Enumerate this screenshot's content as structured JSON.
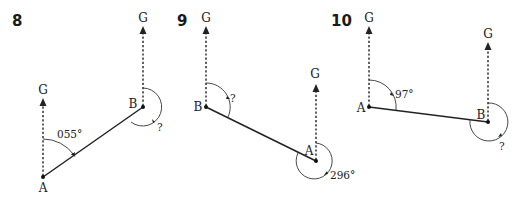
{
  "diagrams": [
    {
      "number": "8",
      "north_label": "G",
      "points": {
        "A": "A",
        "B": "B"
      },
      "angle_at_A": "055°",
      "angle_at_B": "?"
    },
    {
      "number": "9",
      "north_label": "G",
      "points": {
        "A": "A",
        "B": "B"
      },
      "angle_at_B": "?",
      "angle_at_A": "296°"
    },
    {
      "number": "10",
      "north_label": "G",
      "points": {
        "A": "A",
        "B": "B"
      },
      "angle_at_A": "97°",
      "angle_at_B": "?"
    }
  ]
}
